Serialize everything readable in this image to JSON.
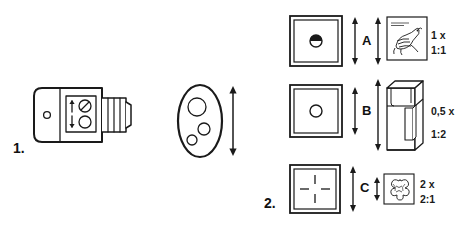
{
  "figure": {
    "background_color": "#ffffff",
    "line_color": "#1a1a1a"
  },
  "steps": [
    {
      "id": "step-1",
      "label": "1."
    },
    {
      "id": "step-2",
      "label": "2."
    }
  ],
  "left_group": {
    "connector": {
      "name": "valve-connector-body",
      "detail_panel": {
        "name": "connector-detail-panel",
        "arrow_up": "up-arrow",
        "arrow_down": "down-arrow",
        "circles": 2
      },
      "port_hole": "connector-port-hole",
      "threaded_nozzle": "threaded-nozzle"
    }
  },
  "middle_group": {
    "oval": {
      "name": "oval-gasket",
      "holes": [
        {
          "size": "large"
        },
        {
          "size": "medium"
        },
        {
          "size": "small"
        }
      ]
    },
    "dimension_arrow": "vertical-double-arrow"
  },
  "right_group": {
    "sections": [
      {
        "id": "section-a",
        "letter": "A",
        "square": {
          "name": "square-plate-a",
          "feature": "half-filled-circle"
        },
        "sample": {
          "name": "bird-stamp",
          "kind": "stamp-bird"
        },
        "quantity": "1 x",
        "scale": "1:1"
      },
      {
        "id": "section-b",
        "letter": "B",
        "square": {
          "name": "square-plate-b",
          "feature": "open-circle"
        },
        "sample": {
          "name": "canister-body",
          "kind": "3d-canister"
        },
        "quantity": "0,5 x",
        "scale": "1:2"
      },
      {
        "id": "section-c",
        "letter": "C",
        "square": {
          "name": "square-plate-c",
          "feature": "crosshair"
        },
        "sample": {
          "name": "flower-stamp",
          "kind": "stamp-flower"
        },
        "quantity": "2 x",
        "scale": "2:1"
      }
    ]
  }
}
